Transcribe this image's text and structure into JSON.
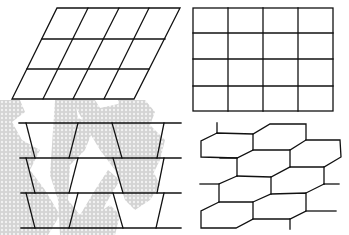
{
  "figure": {
    "panels": [
      {
        "id": "parallelogram-grid",
        "position": "top-left",
        "rows": 3,
        "cols": 4
      },
      {
        "id": "square-grid",
        "position": "top-right",
        "rows": 4,
        "cols": 4
      },
      {
        "id": "trapezoid-rows",
        "position": "bottom-left",
        "rows": 3,
        "trapezoids_per_row": 4
      },
      {
        "id": "hexagonal-tiling",
        "position": "bottom-right",
        "style": "elongated hexagons, staggered"
      }
    ],
    "background_watermark": {
      "color": "#c9c9c9",
      "pattern": "fractal dotted snowflake shapes"
    },
    "line_color": "#111111",
    "background_color": "#ffffff"
  }
}
